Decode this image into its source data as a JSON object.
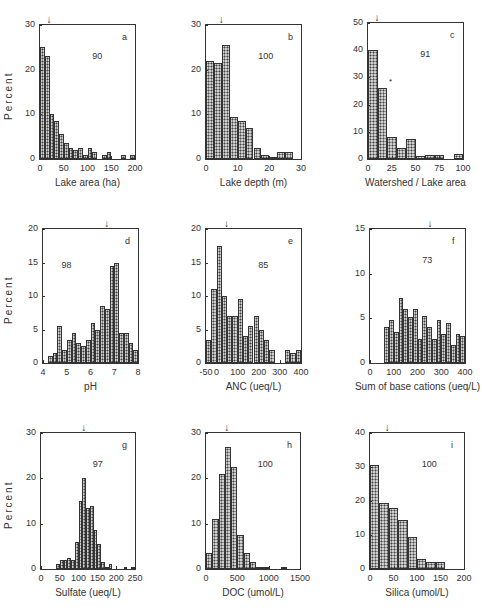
{
  "chart_data": [
    {
      "type": "bar",
      "id": "a",
      "panel_letter": "a",
      "n_label": "90",
      "xlabel": "Lake area (ha)",
      "ylabel": "Percent",
      "xlim": [
        0,
        200
      ],
      "ylim": [
        0,
        30
      ],
      "xticks": [
        0,
        50,
        100,
        150,
        200
      ],
      "yticks": [
        0,
        10,
        20,
        30
      ],
      "bin_width": 10,
      "bin_start": 0,
      "values": [
        25,
        23,
        10,
        8.5,
        5.5,
        3.5,
        2.5,
        2,
        2.5,
        1,
        2.5,
        1.5,
        0,
        1,
        1.5,
        0,
        0,
        1,
        0,
        1
      ],
      "median_arrow": 20
    },
    {
      "type": "bar",
      "id": "b",
      "panel_letter": "b",
      "n_label": "100",
      "xlabel": "Lake depth (m)",
      "ylabel": "",
      "xlim": [
        0,
        30
      ],
      "ylim": [
        0,
        30
      ],
      "xticks": [
        0,
        10,
        20,
        30
      ],
      "yticks": [
        0,
        10,
        20,
        30
      ],
      "bin_width": 2.5,
      "bin_start": 0,
      "values": [
        22,
        21.5,
        25.5,
        9.5,
        8.5,
        7,
        2.5,
        1,
        0.5,
        1.5,
        1.5
      ],
      "median_arrow": 5
    },
    {
      "type": "bar",
      "id": "c",
      "panel_letter": "c",
      "n_label": "91",
      "xlabel": "Watershed / Lake area",
      "ylabel": "",
      "xlim": [
        0,
        100
      ],
      "ylim": [
        0,
        50
      ],
      "xticks": [
        0,
        25,
        50,
        75,
        100
      ],
      "yticks": [
        0,
        10,
        20,
        30,
        40,
        50
      ],
      "bin_width": 10,
      "bin_start": 0,
      "values": [
        40,
        26,
        8,
        4,
        7.5,
        1,
        1.5,
        1.5,
        0,
        2
      ],
      "median_arrow": 10,
      "annotation": "*"
    },
    {
      "type": "bar",
      "id": "d",
      "panel_letter": "d",
      "n_label": "98",
      "xlabel": "pH",
      "ylabel": "Percent",
      "xlim": [
        4,
        8
      ],
      "ylim": [
        0,
        20
      ],
      "xticks": [
        4,
        5,
        6,
        7,
        8
      ],
      "yticks": [
        0,
        5,
        10,
        15,
        20
      ],
      "bin_width": 0.2,
      "bin_start": 4.2,
      "values": [
        1,
        1.5,
        5.5,
        2,
        3.5,
        4.5,
        3,
        2.5,
        3.5,
        6,
        5,
        8.5,
        8,
        14.5,
        15,
        4.5,
        4.5,
        3,
        2
      ],
      "median_arrow": 6.7
    },
    {
      "type": "bar",
      "id": "e",
      "panel_letter": "e",
      "n_label": "85",
      "xlabel": "ANC (ueq/L)",
      "ylabel": "",
      "xlim": [
        -50,
        400
      ],
      "ylim": [
        0,
        20
      ],
      "xticks": [
        -50,
        0,
        100,
        200,
        300,
        400
      ],
      "yticks": [
        0,
        5,
        10,
        15,
        20
      ],
      "bin_width": 25,
      "bin_start": -50,
      "values": [
        3.5,
        11,
        17.5,
        10,
        7,
        7,
        9.5,
        4,
        5.5,
        7,
        5,
        3.5,
        2,
        0,
        0,
        2,
        1.5,
        2
      ],
      "median_arrow": 50
    },
    {
      "type": "bar",
      "id": "f",
      "panel_letter": "f",
      "n_label": "73",
      "xlabel": "Sum of base cations (ueq/L)",
      "ylabel": "",
      "xlim": [
        0,
        400
      ],
      "ylim": [
        0,
        15
      ],
      "xticks": [
        0,
        100,
        200,
        300,
        400
      ],
      "yticks": [
        0,
        5,
        10,
        15
      ],
      "bin_width": 20,
      "bin_start": 60,
      "values": [
        4,
        4.8,
        3.5,
        7.3,
        6,
        5.2,
        6,
        2.7,
        5.3,
        4,
        2.7,
        4.8,
        3.3,
        4.5,
        2,
        3.3,
        3
      ],
      "median_arrow": 255
    },
    {
      "type": "bar",
      "id": "g",
      "panel_letter": "g",
      "n_label": "97",
      "xlabel": "Sulfate (ueq/L)",
      "ylabel": "Percent",
      "xlim": [
        0,
        250
      ],
      "ylim": [
        0,
        30
      ],
      "xticks": [
        0,
        50,
        100,
        150,
        200,
        250
      ],
      "yticks": [
        0,
        10,
        20,
        30
      ],
      "bin_width": 10,
      "bin_start": 40,
      "values": [
        1,
        2,
        2,
        2.5,
        2,
        6,
        15,
        20,
        13.5,
        14,
        8.5,
        5.5,
        1.5,
        0.5,
        1,
        0,
        0,
        0,
        0.5,
        0,
        0.5
      ],
      "median_arrow": 115
    },
    {
      "type": "bar",
      "id": "h",
      "panel_letter": "h",
      "n_label": "100",
      "xlabel": "DOC (umol/L)",
      "ylabel": "",
      "xlim": [
        0,
        1500
      ],
      "ylim": [
        0,
        30
      ],
      "xticks": [
        0,
        500,
        1000,
        1500
      ],
      "yticks": [
        0,
        10,
        20,
        30
      ],
      "bin_width": 100,
      "bin_start": 0,
      "values": [
        3.5,
        11,
        21,
        27,
        22.5,
        7.5,
        3.5,
        1.5,
        0.5,
        0.5,
        0,
        0,
        0.5
      ],
      "median_arrow": 340
    },
    {
      "type": "bar",
      "id": "i",
      "panel_letter": "i",
      "n_label": "100",
      "xlabel": "Silica (umol/L)",
      "ylabel": "",
      "xlim": [
        0,
        200
      ],
      "ylim": [
        0,
        40
      ],
      "xticks": [
        0,
        50,
        100,
        150,
        200
      ],
      "yticks": [
        0,
        10,
        20,
        30,
        40
      ],
      "bin_width": 20,
      "bin_start": 0,
      "values": [
        30.5,
        19.5,
        18,
        14.5,
        9.5,
        3,
        2,
        2
      ],
      "median_arrow": 38
    }
  ],
  "layout": {
    "panels": [
      {
        "left": 39,
        "top": 24,
        "width": 97,
        "height": 136
      },
      {
        "left": 205,
        "top": 24,
        "width": 97,
        "height": 136
      },
      {
        "left": 367,
        "top": 22,
        "width": 97,
        "height": 138
      },
      {
        "left": 42,
        "top": 228,
        "width": 97,
        "height": 136
      },
      {
        "left": 205,
        "top": 228,
        "width": 97,
        "height": 136
      },
      {
        "left": 369,
        "top": 228,
        "width": 97,
        "height": 136
      },
      {
        "left": 40,
        "top": 432,
        "width": 96,
        "height": 138
      },
      {
        "left": 205,
        "top": 432,
        "width": 96,
        "height": 138
      },
      {
        "left": 369,
        "top": 432,
        "width": 96,
        "height": 138
      }
    ]
  }
}
